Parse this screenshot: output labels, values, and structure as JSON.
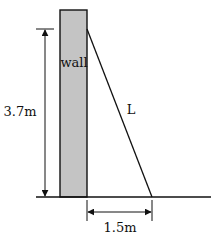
{
  "diagram": {
    "labels": {
      "wall": "wall",
      "height": "3.7m",
      "ladder": "L",
      "base_distance": "1.5m"
    },
    "colors": {
      "wall_fill": "#c4c4c4",
      "stroke": "#111111",
      "background": "#ffffff"
    },
    "values": {
      "height_m": 3.7,
      "base_distance_m": 1.5,
      "ladder_length": "L"
    }
  }
}
